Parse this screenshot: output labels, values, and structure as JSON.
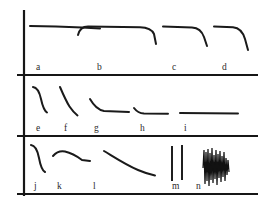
{
  "figure": {
    "background_color": "#ffffff",
    "ink_color": "#1a1a1a",
    "axis_color": "#161616",
    "panel_count": 3,
    "curve_count": 14
  },
  "axes": {
    "vertical_axis": {
      "name": "y-axis",
      "x": 24,
      "y_top": 10,
      "y_bottom": 196
    },
    "baselines": [
      {
        "name": "panel-a-baseline",
        "y": 75,
        "x_start": 17,
        "x_end": 258
      },
      {
        "name": "panel-b-baseline",
        "y": 136,
        "x_start": 17,
        "x_end": 258
      },
      {
        "name": "panel-c-baseline",
        "y": 194,
        "x_start": 17,
        "x_end": 258
      }
    ]
  },
  "panels": [
    {
      "id": "panel-top",
      "name": "Top panel",
      "row": 1,
      "curves": [
        {
          "label": "a",
          "label_x": 36,
          "label_y": 70,
          "shape": "flat plateau, very slight decline, no terminal drop",
          "path": "M30,26 L56,26.6 L82,27.6 L100,28.4"
        },
        {
          "label": "b",
          "label_x": 97,
          "label_y": 70,
          "shape": "short rising shoulder, long plateau, sharp terminal drop",
          "path": "M78,35 C79.5,28.5 83,26.4 88,26.4 L140,27.2 C148,27.4 152,29.5 154,34 L156,44"
        },
        {
          "label": "c",
          "label_x": 172,
          "label_y": 70,
          "shape": "plateau then steep terminal drop",
          "path": "M163,26.6 L192,27.4 C199,27.8 202,31 204,37 L207,46"
        },
        {
          "label": "d",
          "label_x": 222,
          "label_y": 70,
          "shape": "short plateau then long steep terminal drop",
          "path": "M214,26.6 L233,27.2 C240,27.8 243,32 245,39 L248,50"
        }
      ]
    },
    {
      "id": "panel-middle",
      "name": "Middle panel",
      "row": 2,
      "curves": [
        {
          "label": "e",
          "label_x": 36,
          "label_y": 131,
          "shape": "sigmoid fall from high to low, steep mid-slope",
          "path": "M33,87 C37.5,87.5 39.5,92 41,99 C42.5,106 44,110.5 47,112.5"
        },
        {
          "label": "f",
          "label_x": 64,
          "label_y": 131,
          "shape": "concave decay, steep then flattening",
          "path": "M60,87 C63,94 66,101 69.5,106.5 C72.5,111 75,113.5 77.5,115.5"
        },
        {
          "label": "g",
          "label_x": 94,
          "label_y": 131,
          "shape": "exponential decay to plateau",
          "path": "M90,99 C94,106 98.5,110 104,111 L129,112"
        },
        {
          "label": "h",
          "label_x": 140,
          "label_y": 131,
          "shape": "small fast drop then long flat plateau",
          "path": "M134,108 C137,112 140,113.3 144,113.6 L168,113.8"
        },
        {
          "label": "i",
          "label_x": 184,
          "label_y": 131,
          "shape": "flat line, no decay",
          "path": "M180,113 L238,113.6"
        }
      ]
    },
    {
      "id": "panel-bottom",
      "name": "Bottom panel",
      "row": 3,
      "curves": [
        {
          "label": "j",
          "label_x": 34,
          "label_y": 189,
          "shape": "sigmoid fall, sharp knee then tail",
          "path": "M31,145 C35.5,145.5 37.5,150 39,158 C40.5,166 42,170.5 45,172"
        },
        {
          "label": "k",
          "label_x": 57,
          "label_y": 189,
          "shape": "rise then gentle decline to plateau",
          "path": "M53,156 C56.5,152 60,150.5 65,151.5 C72,153 78,157 82,160 L90,161"
        },
        {
          "label": "l",
          "label_x": 93,
          "label_y": 189,
          "shape": "long gradual concave decay",
          "path": "M104,151 C114,157 126,165 138,170 C145,173 150,174.5 155,175.5"
        },
        {
          "label": "m",
          "label_x": 172,
          "label_y": 189,
          "shape": "two isolated vertical spikes",
          "spikes": [
            {
              "x": 172,
              "y_top": 146,
              "y_bottom": 181
            },
            {
              "x": 182,
              "y_top": 145,
              "y_bottom": 180
            }
          ]
        },
        {
          "label": "n",
          "label_x": 196,
          "label_y": 189,
          "shape": "dense burst of rapid oscillation spikes",
          "oscillation": {
            "x_start": 203,
            "x_end": 229,
            "y_center": 168,
            "spike_count": 22,
            "max_amplitude": 21
          }
        }
      ]
    }
  ]
}
